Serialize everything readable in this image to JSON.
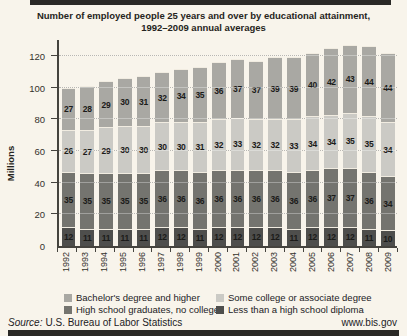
{
  "title": {
    "line1": "Number of employed people 25 years and over by educational attainment,",
    "line2": "1992–2009 annual averages"
  },
  "chart_data": {
    "type": "bar",
    "stacked": true,
    "title": "Number of employed people 25 years and over by educational attainment, 1992–2009 annual averages",
    "ylabel": "Millions",
    "xlabel": "",
    "ylim": [
      0,
      130
    ],
    "yticks": [
      0,
      20,
      40,
      60,
      80,
      100,
      120
    ],
    "grid": "horizontal-dotted",
    "legend_position": "bottom",
    "categories": [
      "1992",
      "1993",
      "1994",
      "1995",
      "1996",
      "1997",
      "1998",
      "1999",
      "2000",
      "2001",
      "2002",
      "2003",
      "2004",
      "2005",
      "2006",
      "2007",
      "2008",
      "2009"
    ],
    "series": [
      {
        "name": "Less than a high school diploma",
        "color": "#4e4e4c",
        "values": [
          12,
          11,
          11,
          11,
          11,
          12,
          12,
          11,
          12,
          12,
          12,
          12,
          11,
          12,
          12,
          12,
          11,
          10
        ]
      },
      {
        "name": "High school graduates, no college",
        "color": "#74746f",
        "values": [
          35,
          35,
          35,
          35,
          35,
          36,
          36,
          36,
          36,
          36,
          36,
          36,
          36,
          36,
          37,
          37,
          36,
          34
        ]
      },
      {
        "name": "Some college or associate degree",
        "color": "#cbcac5",
        "values": [
          26,
          27,
          29,
          30,
          30,
          30,
          30,
          31,
          32,
          33,
          32,
          32,
          33,
          34,
          34,
          35,
          35,
          34
        ]
      },
      {
        "name": "Bachelor's degree and higher",
        "color": "#a9a8a3",
        "values": [
          27,
          28,
          29,
          30,
          31,
          32,
          34,
          35,
          36,
          37,
          37,
          39,
          39,
          40,
          42,
          43,
          44,
          44
        ]
      }
    ]
  },
  "legend": {
    "rows": [
      [
        {
          "label": "Bachelor's degree and higher",
          "color": "#a9a8a3"
        },
        {
          "label": "Some college or associate degree",
          "color": "#cbcac5"
        }
      ],
      [
        {
          "label": "High school graduates, no college",
          "color": "#74746f"
        },
        {
          "label": "Less than a high school diploma",
          "color": "#4e4e4c"
        }
      ]
    ]
  },
  "footer": {
    "source_label": "Source:",
    "source_text": "U.S. Bureau of Labor Statistics",
    "url": "www.bis.gov"
  },
  "colors": {
    "background": "#f8f4eb",
    "axis": "#45433e",
    "gridline": "#99968e",
    "rule": "#2a2926"
  }
}
